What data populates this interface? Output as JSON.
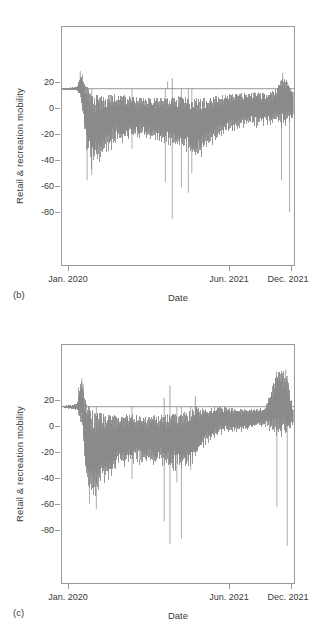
{
  "figure": {
    "panels": [
      {
        "tag": "(b)",
        "ylabel": "Retail & recreation mobility",
        "xlabel": "Date",
        "yticks": [
          "20",
          "0",
          "-20",
          "-40",
          "-60",
          "-80"
        ],
        "xticks": [
          "Jan. 2020",
          "Jun. 2021",
          "Dec. 2021"
        ]
      },
      {
        "tag": "(c)",
        "ylabel": "Retail & recreation mobility",
        "xlabel": "Date",
        "yticks": [
          "20",
          "0",
          "-20",
          "-40",
          "-60",
          "-80"
        ],
        "xticks": [
          "Jan. 2020",
          "Jun. 2021",
          "Dec. 2021"
        ]
      }
    ]
  },
  "style": {
    "series_color": "#8a8a8a",
    "axis_color": "#9a9a9a",
    "text_color": "#3a3a3a",
    "background": "#ffffff"
  },
  "chart_data": [
    {
      "type": "line",
      "panel": "(b)",
      "title": "",
      "xlabel": "Date",
      "ylabel": "Retail & recreation mobility",
      "xlim": [
        "2020-01-01",
        "2021-12-31"
      ],
      "ylim": [
        -100,
        35
      ],
      "yticks": [
        20,
        0,
        -20,
        -40,
        -60,
        -80
      ],
      "xtick_labels": [
        "Jan. 2020",
        "Jun. 2021",
        "Dec. 2021"
      ],
      "xtick_positions": [
        0.0,
        0.72,
        1.0
      ],
      "grid": false,
      "legend": null,
      "zero_reference_line": 0,
      "description": "Daily Google COVID-19 community mobility index for retail & recreation, Jan 2020 - Dec 2021. Flat near 0 until late Feb 2020, sharp collapse to about -45 in Apr 2020, slow partial recovery through 2021, with isolated deep holiday spikes down to -75 and brief positive spikes to +10.",
      "envelope_keypoints": {
        "x_fraction": [
          0.0,
          0.06,
          0.08,
          0.1,
          0.12,
          0.16,
          0.22,
          0.28,
          0.34,
          0.4,
          0.46,
          0.52,
          0.58,
          0.62,
          0.66,
          0.7,
          0.74,
          0.8,
          0.86,
          0.92,
          0.96,
          1.0
        ],
        "upper": [
          0.5,
          1.0,
          8.0,
          2.0,
          -2.0,
          -4.0,
          -3.0,
          -4.0,
          -5.0,
          -5.0,
          -5.0,
          -4.0,
          -5.0,
          -5.0,
          -4.0,
          -3.0,
          -2.0,
          -2.0,
          -2.0,
          -1.0,
          8.0,
          -2.0
        ],
        "lower": [
          -0.5,
          -1.0,
          -6.0,
          -30.0,
          -42.0,
          -38.0,
          -30.0,
          -27.0,
          -26.0,
          -27.0,
          -30.0,
          -32.0,
          -38.0,
          -34.0,
          -28.0,
          -24.0,
          -22.0,
          -20.0,
          -20.0,
          -18.0,
          -20.0,
          -16.0
        ]
      },
      "deep_spikes": [
        {
          "x_fraction": 0.105,
          "value": -52
        },
        {
          "x_fraction": 0.125,
          "value": -49
        },
        {
          "x_fraction": 0.3,
          "value": -34
        },
        {
          "x_fraction": 0.445,
          "value": -53
        },
        {
          "x_fraction": 0.475,
          "value": -74
        },
        {
          "x_fraction": 0.515,
          "value": -56
        },
        {
          "x_fraction": 0.545,
          "value": -59
        },
        {
          "x_fraction": 0.56,
          "value": -48
        },
        {
          "x_fraction": 0.95,
          "value": -52
        },
        {
          "x_fraction": 0.985,
          "value": -70
        }
      ],
      "positive_spikes": [
        {
          "x_fraction": 0.075,
          "value": 10
        },
        {
          "x_fraction": 0.085,
          "value": 8
        },
        {
          "x_fraction": 0.455,
          "value": 4
        },
        {
          "x_fraction": 0.475,
          "value": 6
        },
        {
          "x_fraction": 0.955,
          "value": 9
        }
      ]
    },
    {
      "type": "line",
      "panel": "(c)",
      "title": "",
      "xlabel": "Date",
      "ylabel": "Retail & recreation mobility",
      "xlim": [
        "2020-01-01",
        "2021-12-31"
      ],
      "ylim": [
        -100,
        35
      ],
      "yticks": [
        20,
        0,
        -20,
        -40,
        -60,
        -80
      ],
      "xtick_labels": [
        "Jan. 2020",
        "Jun. 2021",
        "Dec. 2021"
      ],
      "xtick_positions": [
        0.0,
        0.72,
        1.0
      ],
      "grid": false,
      "legend": null,
      "zero_reference_line": 0,
      "description": "Second region's daily retail & recreation mobility index, Jan 2020 - Dec 2021. Similar collapse to about -50 in spring 2020, deeper holiday spikes reaching -78, stronger recovery toward 0 in late 2021, and two prominent positive spikes reaching +20 in December 2021.",
      "envelope_keypoints": {
        "x_fraction": [
          0.0,
          0.06,
          0.08,
          0.1,
          0.13,
          0.18,
          0.24,
          0.3,
          0.36,
          0.42,
          0.48,
          0.54,
          0.58,
          0.62,
          0.66,
          0.7,
          0.76,
          0.82,
          0.88,
          0.93,
          0.97,
          1.0
        ],
        "upper": [
          0.5,
          1.5,
          16.0,
          3.0,
          -2.0,
          -4.0,
          -4.0,
          -4.0,
          -5.0,
          -4.0,
          -4.0,
          -3.0,
          1.0,
          -1.0,
          0.0,
          0.0,
          -1.0,
          -1.0,
          0.0,
          20.0,
          21.0,
          -1.0
        ],
        "lower": [
          -0.5,
          -1.5,
          -8.0,
          -38.0,
          -48.0,
          -40.0,
          -33.0,
          -30.0,
          -30.0,
          -31.0,
          -33.0,
          -34.0,
          -26.0,
          -20.0,
          -16.0,
          -14.0,
          -13.0,
          -12.0,
          -10.0,
          -14.0,
          -16.0,
          -10.0
        ]
      },
      "deep_spikes": [
        {
          "x_fraction": 0.115,
          "value": -55
        },
        {
          "x_fraction": 0.145,
          "value": -58
        },
        {
          "x_fraction": 0.3,
          "value": -41
        },
        {
          "x_fraction": 0.44,
          "value": -65
        },
        {
          "x_fraction": 0.465,
          "value": -78
        },
        {
          "x_fraction": 0.495,
          "value": -43
        },
        {
          "x_fraction": 0.515,
          "value": -75
        },
        {
          "x_fraction": 0.555,
          "value": -36
        },
        {
          "x_fraction": 0.575,
          "value": -26
        },
        {
          "x_fraction": 0.93,
          "value": -57
        },
        {
          "x_fraction": 0.975,
          "value": -79
        }
      ],
      "positive_spikes": [
        {
          "x_fraction": 0.068,
          "value": 11
        },
        {
          "x_fraction": 0.082,
          "value": 16
        },
        {
          "x_fraction": 0.088,
          "value": 13
        },
        {
          "x_fraction": 0.44,
          "value": 5
        },
        {
          "x_fraction": 0.465,
          "value": 12
        },
        {
          "x_fraction": 0.575,
          "value": 6
        },
        {
          "x_fraction": 0.928,
          "value": 20
        },
        {
          "x_fraction": 0.968,
          "value": 21
        }
      ]
    }
  ]
}
